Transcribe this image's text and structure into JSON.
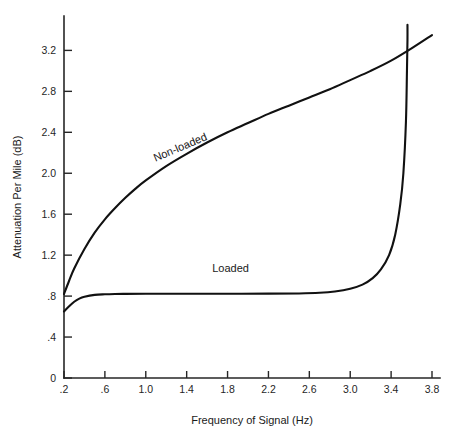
{
  "chart_data": {
    "type": "line",
    "title": "",
    "xlabel": "Frequency of Signal (Hz)",
    "ylabel": "Attenuation Per Mile (dB)",
    "xlim": [
      0.2,
      3.8
    ],
    "ylim": [
      0,
      3.45
    ],
    "grid": false,
    "legend_position": "inline-annotations",
    "x_ticks": [
      0.2,
      0.6,
      1.0,
      1.4,
      1.8,
      2.2,
      2.6,
      3.0,
      3.4,
      3.8
    ],
    "x_tick_labels": [
      ".2",
      ".6",
      "1.0",
      "1.4",
      "1.8",
      "2.2",
      "2.6",
      "3.0",
      "3.4",
      "3.8"
    ],
    "y_ticks": [
      0,
      0.4,
      0.8,
      1.2,
      1.6,
      2.0,
      2.4,
      2.8,
      3.2
    ],
    "y_tick_labels": [
      "0",
      ".4",
      ".8",
      "1.2",
      "1.6",
      "2.0",
      "2.4",
      "2.8",
      "3.2"
    ],
    "series": [
      {
        "name": "Non-loaded",
        "label": "Non-loaded",
        "label_x": 1.35,
        "label_y": 2.22,
        "label_rotation": -23,
        "color": "#111111",
        "x": [
          0.2,
          0.25,
          0.3,
          0.4,
          0.5,
          0.6,
          0.7,
          0.8,
          0.9,
          1.0,
          1.2,
          1.4,
          1.6,
          1.8,
          2.0,
          2.2,
          2.4,
          2.6,
          2.8,
          3.0,
          3.2,
          3.4,
          3.6,
          3.8
        ],
        "y": [
          0.82,
          0.95,
          1.07,
          1.26,
          1.42,
          1.55,
          1.66,
          1.76,
          1.85,
          1.93,
          2.07,
          2.19,
          2.3,
          2.4,
          2.49,
          2.58,
          2.66,
          2.74,
          2.82,
          2.91,
          3.0,
          3.1,
          3.22,
          3.35
        ]
      },
      {
        "name": "Loaded",
        "label": "Loaded",
        "label_x": 1.83,
        "label_y": 1.04,
        "label_rotation": 0,
        "color": "#111111",
        "x": [
          0.2,
          0.25,
          0.3,
          0.35,
          0.4,
          0.5,
          0.6,
          0.7,
          0.8,
          1.0,
          1.4,
          1.8,
          2.2,
          2.5,
          2.7,
          2.85,
          3.0,
          3.12,
          3.22,
          3.3,
          3.38,
          3.44,
          3.49,
          3.52,
          3.545,
          3.555,
          3.56,
          3.56
        ],
        "y": [
          0.65,
          0.7,
          0.745,
          0.775,
          0.793,
          0.812,
          0.818,
          0.821,
          0.822,
          0.823,
          0.823,
          0.823,
          0.824,
          0.826,
          0.832,
          0.845,
          0.872,
          0.912,
          0.975,
          1.06,
          1.2,
          1.4,
          1.7,
          2.0,
          2.5,
          3.0,
          3.3,
          3.45
        ]
      }
    ]
  },
  "axes_geometry": {
    "plot_left_px": 64,
    "plot_right_px": 432,
    "plot_bottom_px": 378,
    "plot_top_px": 16,
    "x_min": 0.2,
    "x_max": 3.8,
    "y_min": 0,
    "y_max": 3.536
  },
  "colors": {
    "background": "#ffffff",
    "axis": "#262626",
    "curve": "#111111",
    "text": "#1a1a1a"
  }
}
